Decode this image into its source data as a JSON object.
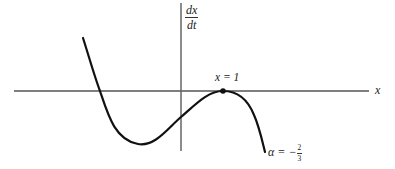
{
  "diagram": {
    "type": "phase-line plot (dx/dt vs x)",
    "axes": {
      "x_label": "x",
      "y_label_num": "dx",
      "y_label_den": "dt"
    },
    "annotations": {
      "point_label": "x = 1",
      "parameter_label_prefix": "α = −",
      "parameter_num": "2",
      "parameter_den": "3"
    },
    "marked_point": {
      "x": 1,
      "dxdt": 0,
      "description": "tangent (double root) at x = 1"
    },
    "colors": {
      "axis": "#555555",
      "curve": "#111111",
      "background": "#ffffff"
    }
  }
}
